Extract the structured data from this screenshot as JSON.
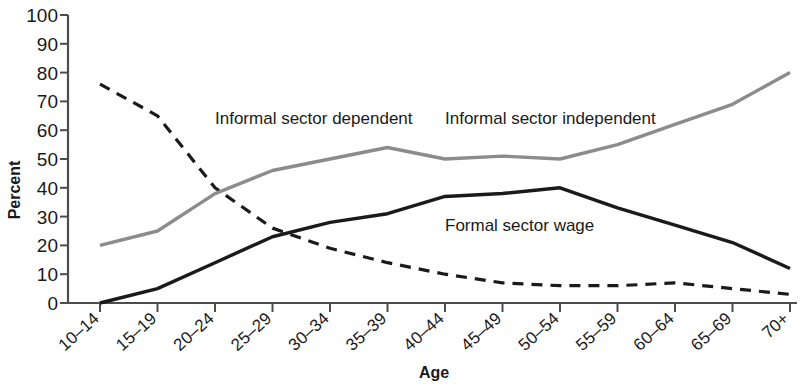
{
  "chart_data": {
    "type": "line",
    "title": "",
    "xlabel": "Age",
    "ylabel": "Percent",
    "ylim": [
      0,
      100
    ],
    "ytick_step": 10,
    "grid": false,
    "legend_position": "inline-annotations",
    "categories": [
      "10–14",
      "15–19",
      "20–24",
      "25–29",
      "30–34",
      "35–39",
      "40–44",
      "45–49",
      "50–54",
      "55–59",
      "60–64",
      "65–69",
      "70+"
    ],
    "yticks": [
      0,
      10,
      20,
      30,
      40,
      50,
      60,
      70,
      80,
      90,
      100
    ],
    "series": [
      {
        "name": "Informal sector dependent",
        "style": "dashed",
        "color": "#1a1a1a",
        "values": [
          76,
          65,
          40,
          26,
          19,
          14,
          10,
          7,
          6,
          6,
          7,
          5,
          3
        ],
        "label_x_category": "20–24",
        "label_y_value": 62
      },
      {
        "name": "Informal sector independent",
        "style": "solid",
        "color": "#8c8c8c",
        "values": [
          20,
          25,
          38,
          46,
          50,
          54,
          50,
          51,
          50,
          55,
          62,
          69,
          80
        ],
        "label_x_category": "40–44",
        "label_y_value": 62
      },
      {
        "name": "Formal sector wage",
        "style": "solid",
        "color": "#1a1a1a",
        "values": [
          0,
          5,
          14,
          23,
          28,
          31,
          37,
          38,
          40,
          33,
          27,
          21,
          12
        ],
        "label_x_category": "40–44",
        "label_y_value": 25
      }
    ]
  },
  "axes": {
    "y_axis_title": "Percent",
    "x_axis_title": "Age"
  },
  "colors": {
    "axis": "#4d4d4d",
    "text": "#1a1a1a",
    "series_gray": "#8c8c8c",
    "series_black": "#1a1a1a",
    "background": "#ffffff"
  }
}
